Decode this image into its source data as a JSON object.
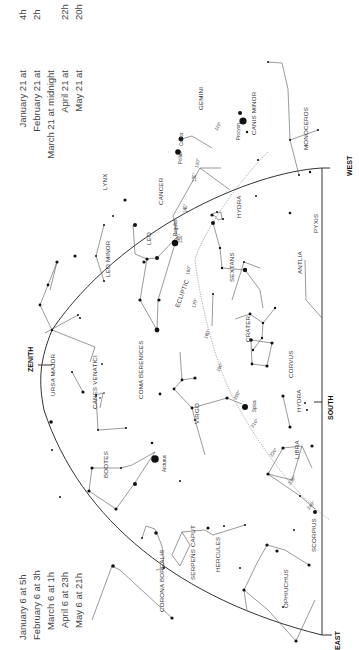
{
  "chart_title": "Evening sky star chart (spring)",
  "directions": {
    "west": "WEST",
    "south": "SOUTH",
    "east": "EAST",
    "zenith": "ZENITH"
  },
  "ecliptic_label": "ECLIPTIC",
  "times_top": [
    {
      "date": "January 21 at",
      "time": "4h"
    },
    {
      "date": "February 21 at",
      "time": "2h"
    },
    {
      "date": "March 21 at midnight",
      "time": ""
    },
    {
      "date": "April 21 at",
      "time": "22h"
    },
    {
      "date": "May 21 at",
      "time": "20h"
    }
  ],
  "times_bottom": [
    {
      "date": "January 6 at",
      "time": "5h"
    },
    {
      "date": "February 6 at",
      "time": "3h"
    },
    {
      "date": "March 6 at",
      "time": "1h"
    },
    {
      "date": "April 6 at",
      "time": "23h"
    },
    {
      "date": "May 6 at",
      "time": "21h"
    }
  ],
  "constellations": [
    "GEMINI",
    "CANIS MINOR",
    "MONOCEROS",
    "LYNX",
    "CANCER",
    "HYDRA",
    "PYXIS",
    "LEO MINOR",
    "LEO",
    "SEXTANS",
    "ANTLIA",
    "URSA MAJOR",
    "CANES VENATICI",
    "COMA BERENICES",
    "CRATER",
    "CORVUS",
    "VIRGO",
    "HYDRA",
    "BOOTES",
    "LIBRA",
    "SERPENS CAPUT",
    "CORONA BOREALIS",
    "SCORPIUS",
    "HERCULES",
    "OPHIUCHUS"
  ],
  "stars": [
    "Castor",
    "Pollux",
    "Procyon",
    "Regulus",
    "Spica",
    "Arcturus"
  ],
  "ecliptic_ticks": [
    "110°",
    "120°",
    "130°",
    "140°",
    "150°",
    "160°",
    "170°",
    "180°",
    "190°",
    "200°",
    "210°",
    "220°",
    "230°",
    "240°"
  ]
}
